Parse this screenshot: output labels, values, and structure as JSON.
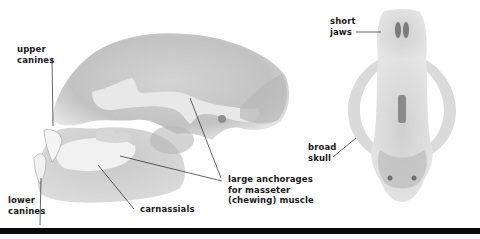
{
  "figure": {
    "views": [
      {
        "name": "side view",
        "description": "lateral view of skull with lower jaw"
      },
      {
        "name": "top view",
        "description": "dorsal view of skull"
      }
    ],
    "labels": {
      "upper_canines": "upper\ncanines",
      "lower_canines": "lower\ncanines",
      "carnassials": "carnassials",
      "masseter": "large anchorages\nfor masseter\n(chewing) muscle",
      "short_jaws": "short\njaws",
      "broad_skull": "broad\nskull"
    },
    "colors": {
      "background": "#ffffff",
      "bone_light": "#e6e6e6",
      "bone_mid": "#c9c9c9",
      "bone_dark": "#9a9a9a",
      "text": "#1a1a1a",
      "bottom_bar": "#0a0a0a"
    }
  }
}
